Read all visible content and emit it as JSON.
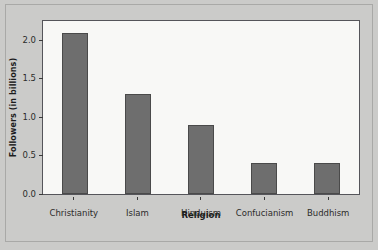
{
  "chart_data": {
    "type": "bar",
    "title": "",
    "xlabel": "Religion",
    "ylabel": "Followers (in billions)",
    "categories": [
      "Christianity",
      "Islam",
      "Hinduism",
      "Confucianism",
      "Buddhism"
    ],
    "values": [
      2.1,
      1.3,
      0.9,
      0.4,
      0.4
    ],
    "ylim": [
      0.0,
      2.25
    ],
    "yticks": [
      "0.0",
      "0.5",
      "1.0",
      "1.5",
      "2.0"
    ],
    "ytick_values": [
      0.0,
      0.5,
      1.0,
      1.5,
      2.0
    ],
    "grid": false,
    "legend": false,
    "legend_position": "none",
    "orientation": "vertical",
    "colors": {
      "bar_fill": "#6e6e6e",
      "bar_edge": "#4a4a4a",
      "plot_background": "#f8f8f6",
      "page_background": "#cbcbc9",
      "axis_line": "#55555a",
      "text": "#2b2b2b"
    }
  }
}
